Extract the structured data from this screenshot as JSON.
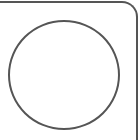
{
  "shapes": {
    "frame": {
      "kind": "rounded-corner-panel-edge",
      "stroke": "#555555"
    },
    "circle": {
      "kind": "circle",
      "stroke": "#555555",
      "fill": "#ffffff"
    }
  }
}
